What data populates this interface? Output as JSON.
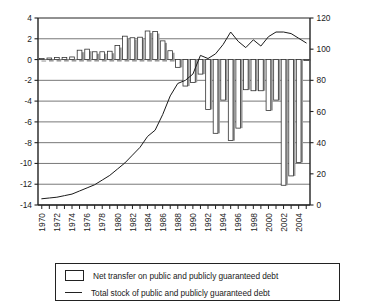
{
  "chart_data": {
    "type": "bar",
    "title": "",
    "subtitle": "",
    "xlabel": "",
    "ylabel": "",
    "grid": true,
    "legend_position": "bottom",
    "x": [
      1970,
      1971,
      1972,
      1973,
      1974,
      1975,
      1976,
      1977,
      1978,
      1979,
      1980,
      1981,
      1982,
      1983,
      1984,
      1985,
      1986,
      1987,
      1988,
      1989,
      1990,
      1991,
      1992,
      1993,
      1994,
      1995,
      1996,
      1997,
      1998,
      1999,
      2000,
      2001,
      2002,
      2003,
      2004,
      2005
    ],
    "x_tick_labels": [
      "1970",
      "1972",
      "1974",
      "1976",
      "1978",
      "1980",
      "1982",
      "1984",
      "1986",
      "1988",
      "1990",
      "1992",
      "1994",
      "1996",
      "1998",
      "2000",
      "2002",
      "2004"
    ],
    "x_tick_values": [
      1970,
      1972,
      1974,
      1976,
      1978,
      1980,
      1982,
      1984,
      1986,
      1988,
      1990,
      1992,
      1994,
      1996,
      1998,
      2000,
      2002,
      2004
    ],
    "left_axis": {
      "label": "",
      "ylim": [
        -14,
        4
      ],
      "ticks": [
        -14,
        -12,
        -10,
        -8,
        -6,
        -4,
        -2,
        0,
        2,
        4
      ],
      "tick_labels": [
        "-14",
        "-12",
        "-10",
        "-8",
        "-6",
        "-4",
        "-2",
        "0",
        "2",
        "4"
      ]
    },
    "right_axis": {
      "label": "",
      "ylim": [
        0,
        120
      ],
      "ticks": [
        0,
        20,
        40,
        60,
        80,
        100,
        120
      ],
      "tick_labels": [
        "0",
        "20",
        "40",
        "60",
        "80",
        "100",
        "120"
      ]
    },
    "series": [
      {
        "name": "Net transfer on public and publicly guaranteed debt",
        "type": "bar",
        "axis": "left",
        "values": [
          0.1,
          0.15,
          0.2,
          0.2,
          0.25,
          0.9,
          1.0,
          0.75,
          0.75,
          0.8,
          1.35,
          2.25,
          2.1,
          2.15,
          2.75,
          2.7,
          1.8,
          0.85,
          -0.75,
          -2.55,
          -2.2,
          -1.4,
          -4.8,
          -7.1,
          -3.9,
          -7.8,
          -6.6,
          -2.9,
          -3.0,
          -3.0,
          -4.9,
          -3.9,
          -12.1,
          -11.2,
          -9.9,
          -0.1
        ]
      },
      {
        "name": "Total stock of public and publicly guaranteed debt",
        "type": "line",
        "axis": "right",
        "values": [
          4,
          4.5,
          5,
          6,
          7,
          9,
          11,
          13,
          16,
          19,
          23,
          27,
          32,
          37,
          44,
          48,
          58,
          70,
          78,
          80,
          84,
          96,
          94,
          97,
          103,
          111,
          105,
          101,
          106,
          102,
          108,
          111,
          111,
          110,
          107,
          104
        ]
      }
    ]
  },
  "legend": {
    "items": [
      {
        "marker": "box-swatch",
        "label": "Net transfer on public and publicly guaranteed debt"
      },
      {
        "marker": "line-swatch",
        "label": "Total stock of public and publicly guaranteed debt"
      }
    ]
  },
  "colors": {
    "axis": "#222222",
    "grid": "#555555",
    "bar_fill": "#ffffff",
    "bar_edge": "#333333",
    "bar_shadow": "#9a9a9a",
    "line": "#1a1a1a",
    "background": "#ffffff"
  }
}
